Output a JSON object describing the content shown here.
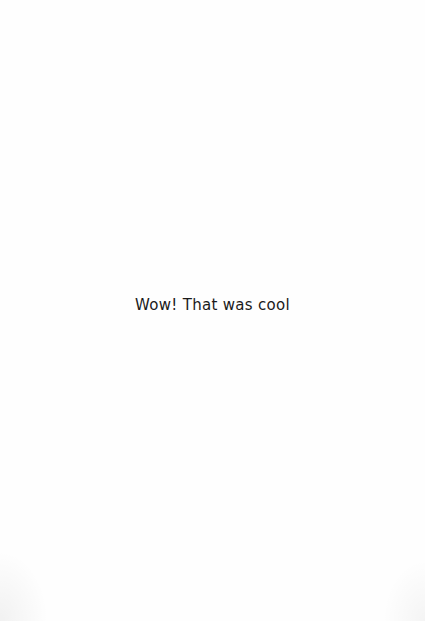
{
  "page": {
    "background_color": "#fefefe",
    "caption": "Wow! That was cool",
    "caption_color": "#1a1a1a"
  }
}
